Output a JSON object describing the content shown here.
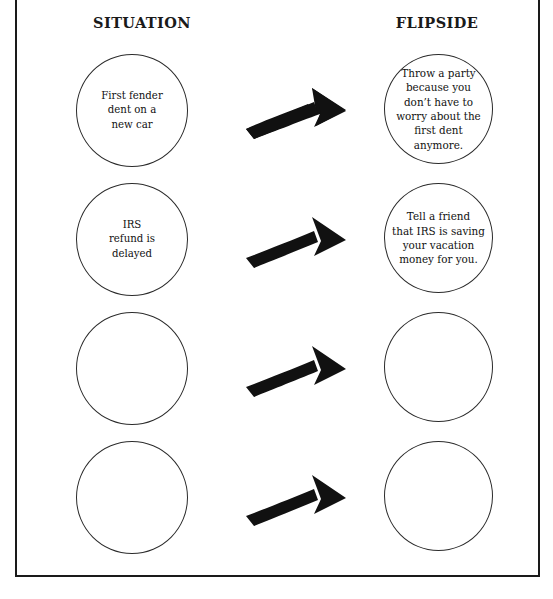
{
  "page": {
    "border_color": "#1a1a1a",
    "background_color": "#ffffff",
    "arrow_color": "#111111",
    "circle_outline_color": "#2b2b2b"
  },
  "headings": {
    "situation": "SITUATION",
    "flipside": "FLIPSIDE"
  },
  "rows": [
    {
      "situation": "First fender\ndent on a\nnew car",
      "flipside": "Throw a party\nbecause you\ndon’t have to\nworry about the\nfirst dent\nanymore.",
      "arrow": "curved-right-arrow-icon"
    },
    {
      "situation": "IRS\nrefund is\ndelayed",
      "flipside": "Tell a friend\nthat IRS is saving\nyour vacation\nmoney for you.",
      "arrow": "curved-right-arrow-icon"
    },
    {
      "situation": "",
      "flipside": "",
      "arrow": "curved-right-arrow-icon"
    },
    {
      "situation": "",
      "flipside": "",
      "arrow": "curved-right-arrow-icon"
    }
  ]
}
